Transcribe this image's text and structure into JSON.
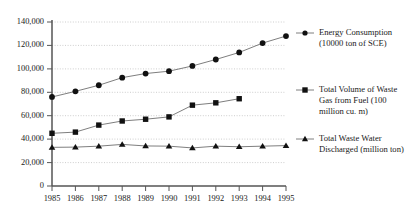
{
  "chart_data": {
    "type": "line",
    "title": "",
    "subtitle": "",
    "xlabel": "",
    "ylabel": "",
    "grid": "horizontal-dotted",
    "legend_position": "right",
    "categories": [
      "1985",
      "1986",
      "1987",
      "1988",
      "1989",
      "1990",
      "1991",
      "1992",
      "1993",
      "1994",
      "1995"
    ],
    "x": [
      1985,
      1986,
      1987,
      1988,
      1989,
      1990,
      1991,
      1992,
      1993,
      1994,
      1995
    ],
    "xlim": [
      1985,
      1995
    ],
    "ylim": [
      0,
      140000
    ],
    "ytick_labels": [
      "0",
      "20,000",
      "40,000",
      "60,000",
      "80,000",
      "100,000",
      "120,000",
      "140,000"
    ],
    "ytick_values": [
      0,
      20000,
      40000,
      60000,
      80000,
      100000,
      120000,
      140000
    ],
    "series": [
      {
        "name": "Energy Consumption (10000 ton of SCE)",
        "marker": "circle",
        "color": "#111111",
        "values": [
          76000,
          80800,
          86000,
          92500,
          96000,
          98000,
          102500,
          108000,
          114000,
          122000,
          128000
        ]
      },
      {
        "name": "Total Volume of Waste Gas from Fuel (100 million cu. m)",
        "marker": "square",
        "color": "#111111",
        "values": [
          45000,
          46000,
          52000,
          55500,
          57000,
          59000,
          69000,
          71000,
          74500,
          null,
          null
        ]
      },
      {
        "name": "Total Waste Water Discharged (million ton)",
        "marker": "triangle",
        "color": "#111111",
        "values": [
          33000,
          33200,
          34000,
          35500,
          34200,
          34000,
          32500,
          34000,
          33500,
          34000,
          34500
        ]
      }
    ]
  },
  "legend": {
    "entries": [
      {
        "marker": "circle-marker-icon",
        "line1": "Energy Consumption",
        "line2": "(10000 ton of SCE)",
        "line3": ""
      },
      {
        "marker": "square-marker-icon",
        "line1": "Total Volume of Waste",
        "line2": "Gas from Fuel (100",
        "line3": "million cu. m)"
      },
      {
        "marker": "triangle-marker-icon",
        "line1": "Total Waste Water",
        "line2": "Discharged (million ton)",
        "line3": ""
      }
    ]
  },
  "axes": {
    "y_labels": [
      "140,000",
      "120,000",
      "100,000",
      "80,000",
      "60,000",
      "40,000",
      "20,000",
      "0"
    ],
    "x_labels": [
      "1985",
      "1986",
      "1987",
      "1988",
      "1989",
      "1990",
      "1991",
      "1992",
      "1993",
      "1994",
      "1995"
    ]
  }
}
